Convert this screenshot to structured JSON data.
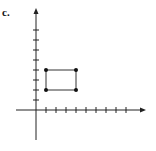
{
  "label": "c.",
  "chart_data": {
    "type": "scatter",
    "title": "",
    "xlabel": "",
    "ylabel": "",
    "grid": false,
    "xlim": [
      -1,
      11
    ],
    "ylim": [
      -3,
      10
    ],
    "x_ticks": [
      1,
      2,
      3,
      4,
      5,
      6,
      7,
      8,
      9
    ],
    "y_ticks": [
      1,
      2,
      3,
      4,
      5,
      6,
      7,
      8
    ],
    "points": [
      {
        "x": 1,
        "y": 2
      },
      {
        "x": 4,
        "y": 2
      },
      {
        "x": 4,
        "y": 4
      },
      {
        "x": 1,
        "y": 4
      }
    ],
    "shape": "rectangle",
    "polygon": [
      [
        1,
        2
      ],
      [
        4,
        2
      ],
      [
        4,
        4
      ],
      [
        1,
        4
      ]
    ]
  },
  "colors": {
    "axis": "#222222",
    "shape": "#333333",
    "point": "#111111"
  }
}
